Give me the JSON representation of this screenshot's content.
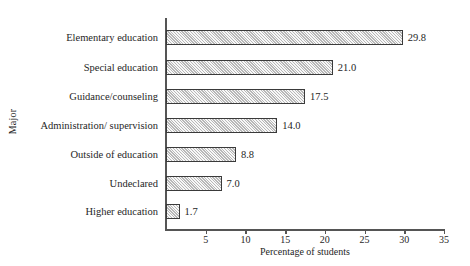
{
  "chart_data": {
    "type": "bar",
    "orientation": "horizontal",
    "title": "",
    "xlabel": "Percentage of students",
    "ylabel": "Major",
    "xlim": [
      0,
      35
    ],
    "xticks": [
      0,
      5,
      10,
      15,
      20,
      25,
      30,
      35
    ],
    "xtick_labels": [
      "",
      "5",
      "10",
      "15",
      "20",
      "25",
      "30",
      "35"
    ],
    "grid": false,
    "legend": null,
    "categories": [
      "Elementary education",
      "Special education",
      "Guidance/counseling",
      "Administration/ supervision",
      "Outside of education",
      "Undeclared",
      "Higher education"
    ],
    "values": [
      29.8,
      21.0,
      17.5,
      14.0,
      8.8,
      7.0,
      1.7
    ],
    "value_labels": [
      "29.8",
      "21.0",
      "17.5",
      "14.0",
      "8.8",
      "7.0",
      "1.7"
    ],
    "bar_fill": "#cfcfcf",
    "bar_edge": "#3a3a3a",
    "axis_color": "#555555",
    "text_color": "#262626",
    "background": "#ffffff"
  }
}
